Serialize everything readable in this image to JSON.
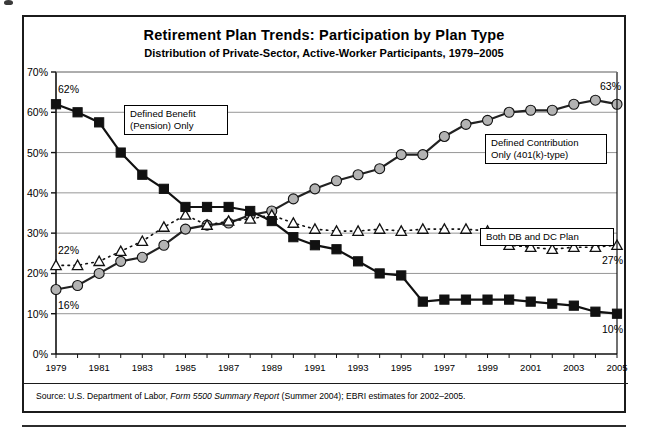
{
  "figure": {
    "title": "Retirement Plan Trends: Participation by Plan Type",
    "subtitle": "Distribution of Private-Sector, Active-Worker Participants, 1979–2005",
    "source_prefix": "Source: U.S. Department of Labor,",
    "source_italic1": "Form 5500",
    "source_italic2": "Summary Report",
    "source_suffix": "(Summer 2004); EBRI estimates for 2002–2005."
  },
  "legend": {
    "db": {
      "line1": "Defined Benefit",
      "line2": "(Pension) Only"
    },
    "dc": {
      "line1": "Defined Contribution",
      "line2": "Only  (401(k)-type)"
    },
    "both": {
      "line1": "Both  DB  and  DC  Plan"
    }
  },
  "annotations": {
    "db_start": "62%",
    "db_end": "10%",
    "dc_start": "16%",
    "dc_end": "63%",
    "both_start": "22%",
    "both_end": "27%"
  },
  "chart_data": {
    "type": "line",
    "title": "Retirement Plan Trends: Participation by Plan Type",
    "subtitle": "Distribution of Private-Sector, Active-Worker Participants, 1979–2005",
    "xlabel": "",
    "ylabel": "",
    "ylim": [
      0,
      70
    ],
    "yticks": [
      0,
      10,
      20,
      30,
      40,
      50,
      60,
      70
    ],
    "ytick_labels": [
      "0%",
      "10%",
      "20%",
      "30%",
      "40%",
      "50%",
      "60%",
      "70%"
    ],
    "grid": "horizontal",
    "legend_position": "inline-callouts",
    "x": [
      1979,
      1980,
      1981,
      1982,
      1983,
      1984,
      1985,
      1986,
      1987,
      1988,
      1989,
      1990,
      1991,
      1992,
      1993,
      1994,
      1995,
      1996,
      1997,
      1998,
      1999,
      2000,
      2001,
      2002,
      2003,
      2004,
      2005
    ],
    "xtick_labels": [
      "1979",
      "1981",
      "1983",
      "1985",
      "1987",
      "1989",
      "1991",
      "1993",
      "1995",
      "1997",
      "1999",
      "2001",
      "2003",
      "2005"
    ],
    "series": [
      {
        "name": "Defined Benefit (Pension) Only",
        "marker": "square",
        "color": "#111111",
        "linestyle": "solid",
        "values": [
          62,
          60,
          57.5,
          50,
          44.5,
          41,
          36.5,
          36.5,
          36.5,
          35.5,
          33,
          29,
          27,
          26,
          23,
          20,
          19.5,
          13,
          13.5,
          13.5,
          13.5,
          13.5,
          13,
          12.5,
          12,
          10.5,
          10
        ]
      },
      {
        "name": "Defined Contribution Only (401(k)-type)",
        "marker": "circle",
        "color": "#b3b3b3",
        "linestyle": "solid",
        "values": [
          16,
          17,
          20,
          23,
          24,
          27,
          31,
          32,
          32.5,
          34.5,
          35.5,
          38.5,
          41,
          43,
          44.5,
          46,
          49.5,
          49.5,
          54,
          57,
          58,
          60,
          60.5,
          60.5,
          62,
          63,
          62
        ]
      },
      {
        "name": "Both DB and DC Plan",
        "marker": "triangle",
        "color": "#111111",
        "linestyle": "dotted",
        "values": [
          22,
          22,
          23,
          25.5,
          28,
          31.5,
          34.5,
          32,
          33,
          33.5,
          34.5,
          32.5,
          31,
          30.5,
          30.5,
          31,
          30.5,
          31,
          31,
          31,
          30.5,
          27,
          26.5,
          26,
          26.5,
          26.5,
          27
        ]
      }
    ]
  }
}
